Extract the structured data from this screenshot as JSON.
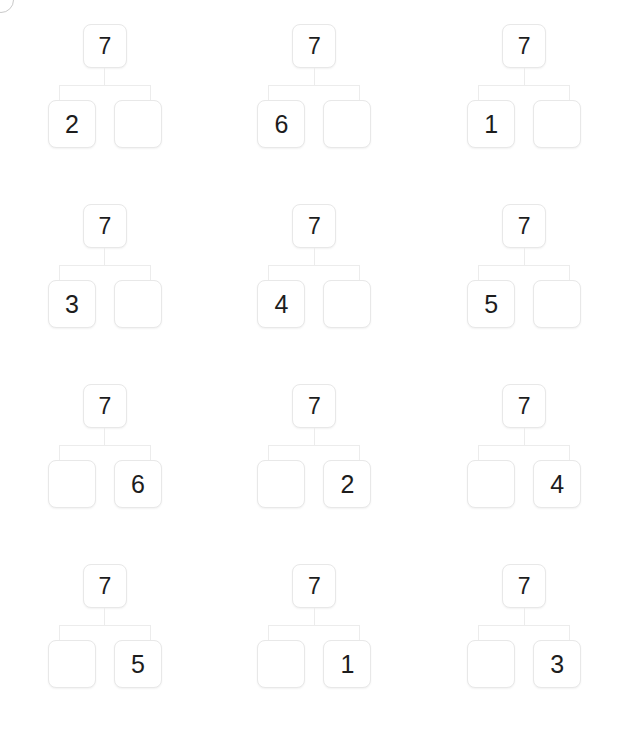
{
  "page": {
    "background_color": "#ffffff",
    "box_border_color": "#e8e8e8",
    "connector_color": "#ececec",
    "text_color": "#1d1d1d",
    "whole_value": "7",
    "columns": 3,
    "rows": 4
  },
  "corner_badge": {
    "name": "clipped-circle-badge",
    "label": ""
  },
  "bonds": [
    {
      "id": "bond-1",
      "whole": "7",
      "left": "2",
      "right": "",
      "left_empty": false,
      "right_empty": true,
      "missing_side": "right"
    },
    {
      "id": "bond-2",
      "whole": "7",
      "left": "6",
      "right": "",
      "left_empty": false,
      "right_empty": true,
      "missing_side": "right"
    },
    {
      "id": "bond-3",
      "whole": "7",
      "left": "1",
      "right": "",
      "left_empty": false,
      "right_empty": true,
      "missing_side": "right"
    },
    {
      "id": "bond-4",
      "whole": "7",
      "left": "3",
      "right": "",
      "left_empty": false,
      "right_empty": true,
      "missing_side": "right"
    },
    {
      "id": "bond-5",
      "whole": "7",
      "left": "4",
      "right": "",
      "left_empty": false,
      "right_empty": true,
      "missing_side": "right"
    },
    {
      "id": "bond-6",
      "whole": "7",
      "left": "5",
      "right": "",
      "left_empty": false,
      "right_empty": true,
      "missing_side": "right"
    },
    {
      "id": "bond-7",
      "whole": "7",
      "left": "",
      "right": "6",
      "left_empty": true,
      "right_empty": false,
      "missing_side": "left"
    },
    {
      "id": "bond-8",
      "whole": "7",
      "left": "",
      "right": "2",
      "left_empty": true,
      "right_empty": false,
      "missing_side": "left"
    },
    {
      "id": "bond-9",
      "whole": "7",
      "left": "",
      "right": "4",
      "left_empty": true,
      "right_empty": false,
      "missing_side": "left"
    },
    {
      "id": "bond-10",
      "whole": "7",
      "left": "",
      "right": "5",
      "left_empty": true,
      "right_empty": false,
      "missing_side": "left"
    },
    {
      "id": "bond-11",
      "whole": "7",
      "left": "",
      "right": "1",
      "left_empty": true,
      "right_empty": false,
      "missing_side": "left"
    },
    {
      "id": "bond-12",
      "whole": "7",
      "left": "",
      "right": "3",
      "left_empty": true,
      "right_empty": false,
      "missing_side": "left"
    }
  ]
}
